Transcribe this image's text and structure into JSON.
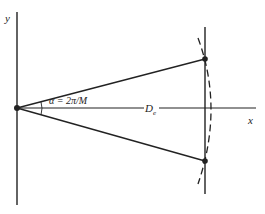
{
  "diagram": {
    "type": "geometry",
    "labels": {
      "y_axis": "y",
      "x_axis": "x",
      "angle": "α = 2π/M",
      "distance_main": "D",
      "distance_sub": "e"
    },
    "colors": {
      "ink": "#222222",
      "background": "#ffffff"
    },
    "elements": {
      "points": [
        "origin",
        "upper-point",
        "lower-point"
      ],
      "lines": [
        "y-axis",
        "x-axis",
        "vertical-chord",
        "upper-ray",
        "lower-ray"
      ],
      "curves": [
        "dashed-circle-arc",
        "angle-arc"
      ]
    }
  }
}
